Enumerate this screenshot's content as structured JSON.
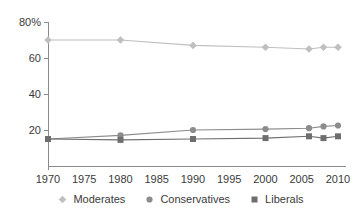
{
  "chart_data": {
    "type": "line",
    "title": "",
    "xlabel": "",
    "ylabel": "",
    "x": [
      1970,
      1980,
      1990,
      2000,
      2006,
      2008,
      2010
    ],
    "series": [
      {
        "name": "Moderates",
        "marker": "diamond",
        "color": "#bfbfbf",
        "values": [
          70,
          70,
          67,
          66,
          65,
          66,
          66
        ]
      },
      {
        "name": "Conservatives",
        "marker": "circle",
        "color": "#8c8c8c",
        "values": [
          15,
          17,
          20,
          20.5,
          21,
          22,
          22.5
        ]
      },
      {
        "name": "Liberals",
        "marker": "square",
        "color": "#6e6e6e",
        "values": [
          15,
          14.5,
          15,
          15.5,
          16.5,
          15.5,
          16.5
        ]
      }
    ],
    "xlim": [
      1970,
      2010
    ],
    "ylim": [
      0,
      80
    ],
    "xticks": [
      1970,
      1975,
      1980,
      1985,
      1990,
      1995,
      2000,
      2005,
      2010
    ],
    "xtick_labels": [
      "1970",
      "1975",
      "1980",
      "1985",
      "1990",
      "1995",
      "2000",
      "2005",
      "2010"
    ],
    "yticks": [
      20,
      40,
      60,
      80
    ],
    "ytick_labels": [
      "20",
      "40",
      "60",
      "80%"
    ],
    "grid": false,
    "legend_position": "bottom-center"
  },
  "legend": {
    "items": [
      {
        "label": "Moderates"
      },
      {
        "label": "Conservatives"
      },
      {
        "label": "Liberals"
      }
    ]
  }
}
